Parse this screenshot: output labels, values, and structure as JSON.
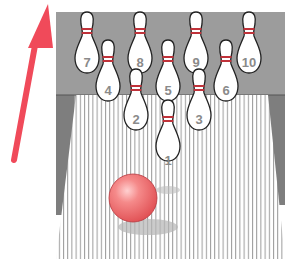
{
  "illustration": {
    "subject": "Bowling lane with ten pins and a ball",
    "arrow": {
      "direction": "up",
      "color": "#f04a5a"
    },
    "ball": {
      "color": "#f26b6b"
    },
    "backdrop_color": "#9a9a9a",
    "lane_color": "#ffffff",
    "pins": [
      {
        "number": "1",
        "x": 168,
        "y": 128
      },
      {
        "number": "2",
        "x": 136,
        "y": 97
      },
      {
        "number": "3",
        "x": 199,
        "y": 97
      },
      {
        "number": "4",
        "x": 108,
        "y": 68
      },
      {
        "number": "5",
        "x": 168,
        "y": 68
      },
      {
        "number": "6",
        "x": 226,
        "y": 68
      },
      {
        "number": "7",
        "x": 87,
        "y": 40
      },
      {
        "number": "8",
        "x": 140,
        "y": 40
      },
      {
        "number": "9",
        "x": 196,
        "y": 40
      },
      {
        "number": "10",
        "x": 249,
        "y": 40
      }
    ]
  }
}
